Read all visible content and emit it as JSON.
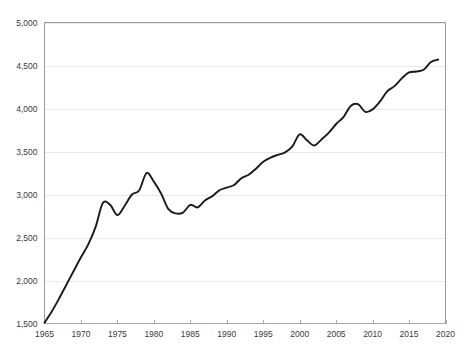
{
  "chart_data": {
    "type": "line",
    "title": "",
    "subtitle": "",
    "xlabel": "",
    "ylabel": "",
    "xlim": [
      1965,
      2020
    ],
    "ylim": [
      1500,
      5000
    ],
    "grid": true,
    "legend": false,
    "legend_position": "none",
    "line_color": "#1a1a1a",
    "gridline_color": "#e9e9e9",
    "axis_color": "#a6a6a6",
    "background_color": "#ffffff",
    "y_ticks": [
      1500,
      2000,
      2500,
      3000,
      3500,
      4000,
      4500,
      5000
    ],
    "y_tick_labels": [
      "1,500",
      "2,000",
      "2,500",
      "3,000",
      "3,500",
      "4,000",
      "4,500",
      "5,000"
    ],
    "x_ticks": [
      1965,
      1970,
      1975,
      1980,
      1985,
      1990,
      1995,
      2000,
      2005,
      2010,
      2015,
      2020
    ],
    "x_tick_labels": [
      "1965",
      "1970",
      "1975",
      "1980",
      "1985",
      "1990",
      "1995",
      "2000",
      "2005",
      "2010",
      "2015",
      "2020"
    ],
    "series": [
      {
        "name": "value",
        "x": [
          1965,
          1966,
          1967,
          1968,
          1969,
          1970,
          1971,
          1972,
          1973,
          1974,
          1975,
          1976,
          1977,
          1978,
          1979,
          1980,
          1981,
          1982,
          1983,
          1984,
          1985,
          1986,
          1987,
          1988,
          1989,
          1990,
          1991,
          1992,
          1993,
          1994,
          1995,
          1996,
          1997,
          1998,
          1999,
          2000,
          2001,
          2002,
          2003,
          2004,
          2005,
          2006,
          2007,
          2008,
          2009,
          2010,
          2011,
          2012,
          2013,
          2014,
          2015,
          2016,
          2017,
          2018,
          2019
        ],
        "values": [
          1510,
          1640,
          1790,
          1950,
          2110,
          2270,
          2420,
          2620,
          2900,
          2880,
          2760,
          2870,
          3000,
          3050,
          3250,
          3150,
          3010,
          2830,
          2780,
          2790,
          2880,
          2850,
          2930,
          2980,
          3050,
          3080,
          3110,
          3190,
          3230,
          3300,
          3380,
          3430,
          3460,
          3490,
          3560,
          3700,
          3630,
          3570,
          3640,
          3720,
          3820,
          3900,
          4030,
          4050,
          3960,
          3990,
          4080,
          4200,
          4260,
          4350,
          4420,
          4430,
          4450,
          4540,
          4570
        ]
      }
    ]
  },
  "axes": {
    "y_axis_name": "y-axis",
    "x_axis_name": "x-axis"
  }
}
